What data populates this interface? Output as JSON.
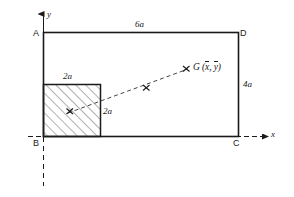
{
  "figure": {
    "type": "engineering-geometry-diagram",
    "stroke_color": "#1a1a1a",
    "hatch_color": "#555555",
    "background": "#ffffff"
  },
  "rectangle": {
    "corners": [
      {
        "name": "A",
        "label": "A",
        "position": "top-left"
      },
      {
        "name": "D",
        "label": "D",
        "position": "top-right"
      },
      {
        "name": "B",
        "label": "B",
        "position": "bottom-left"
      },
      {
        "name": "C",
        "label": "C",
        "position": "bottom-right"
      }
    ],
    "width_label": "6a",
    "height_label": "4a"
  },
  "square": {
    "top_label": "2a",
    "side_label": "2a",
    "hatched": true,
    "hatch_angle_deg": 45
  },
  "axes": {
    "y_label": "y",
    "x_label": "x",
    "origin_point": "B"
  },
  "centroid": {
    "marker": "x-marker",
    "label_prefix": "G",
    "label_open": "(",
    "xbar": "x",
    "comma": ",",
    "ybar": "y",
    "label_close": ")"
  },
  "markers": [
    {
      "name": "square-centroid-marker",
      "glyph": "x"
    },
    {
      "name": "midpoint-marker",
      "glyph": "x"
    },
    {
      "name": "overall-centroid-marker",
      "glyph": "x"
    }
  ]
}
